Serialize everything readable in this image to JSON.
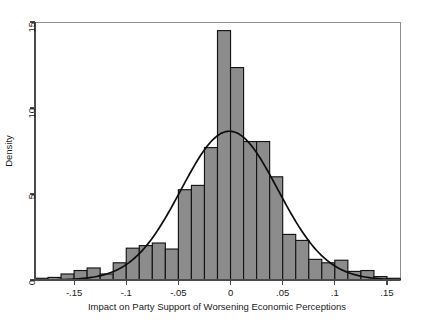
{
  "chart_data": {
    "type": "bar",
    "title": "",
    "xlabel": "Impact on Party Support of Worsening Economic Perceptions",
    "ylabel": "Density",
    "xlim": [
      -0.1875,
      0.1625
    ],
    "ylim": [
      0,
      15
    ],
    "grid": false,
    "legend": null,
    "bin_width": 0.0125,
    "xticks": [
      -0.15,
      -0.1,
      -0.05,
      0,
      0.05,
      0.1,
      0.15
    ],
    "xtick_labels": [
      "-.15",
      "-.1",
      "-.05",
      "0",
      ".05",
      ".1",
      ".15"
    ],
    "yticks": [
      0,
      5,
      10,
      15
    ],
    "ytick_labels": [
      "0",
      "5",
      "10",
      "15"
    ],
    "bar_color": "#8c8c8c",
    "bar_edge_color": "#151515",
    "curve_color": "#0d0d0d",
    "bin_left_edges": [
      -0.1875,
      -0.175,
      -0.1625,
      -0.15,
      -0.1375,
      -0.125,
      -0.1125,
      -0.1,
      -0.0875,
      -0.075,
      -0.0625,
      -0.05,
      -0.0375,
      -0.025,
      -0.0125,
      0,
      0.0125,
      0.025,
      0.0375,
      0.05,
      0.0625,
      0.075,
      0.0875,
      0.1,
      0.1125,
      0.125,
      0.1375,
      0.15
    ],
    "bin_centers": [
      -0.18125,
      -0.16875,
      -0.15625,
      -0.14375,
      -0.13125,
      -0.11875,
      -0.10625,
      -0.09375,
      -0.08125,
      -0.06875,
      -0.05625,
      -0.04375,
      -0.03125,
      -0.01875,
      -0.00625,
      0.00625,
      0.01875,
      0.03125,
      0.04375,
      0.05625,
      0.06875,
      0.08125,
      0.09375,
      0.10625,
      0.11875,
      0.13125,
      0.14375,
      0.15625
    ],
    "values": [
      0.1,
      0.15,
      0.35,
      0.55,
      0.7,
      0.35,
      1.0,
      1.85,
      2.0,
      2.15,
      1.8,
      5.25,
      5.5,
      7.7,
      14.5,
      12.35,
      8.05,
      8.05,
      6.0,
      2.65,
      2.3,
      1.2,
      1.0,
      1.15,
      0.5,
      0.55,
      0.2,
      0.1
    ],
    "curve": {
      "kind": "normal-density-overlay",
      "mean": -0.001,
      "sd": 0.0465,
      "peak": 8.65
    }
  },
  "axis": {
    "x_title": "Impact on Party Support of Worsening Economic Perceptions",
    "y_title": "Density"
  }
}
